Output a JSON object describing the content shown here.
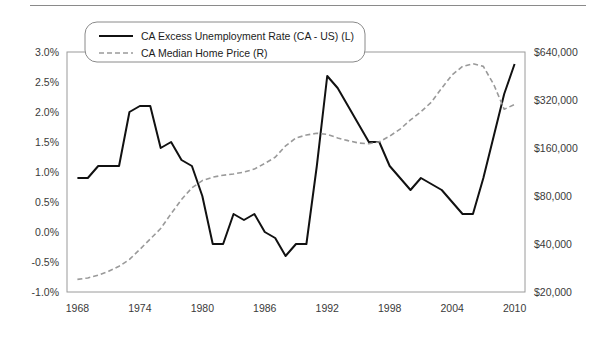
{
  "figure": {
    "background_color": "#ffffff",
    "top_rule_color": "#8a8a8a",
    "plot_border_color": "#9a9a9a"
  },
  "legend": {
    "position": "top-left-inside",
    "border_style": "rounded-rectangle",
    "entries": [
      {
        "label": "CA Excess Unemployment Rate (CA - US) (L)",
        "style": "solid",
        "color": "#111111",
        "axis": "left"
      },
      {
        "label": "CA Median Home Price (R)",
        "style": "dashed",
        "color": "#9a9a9a",
        "axis": "right"
      }
    ]
  },
  "chart_data": {
    "type": "line",
    "title": "",
    "subtitle": "",
    "xlabel": "",
    "ylabel": "",
    "grid": false,
    "legend_position": "upper left",
    "x": [
      1968,
      1969,
      1970,
      1971,
      1972,
      1973,
      1974,
      1975,
      1976,
      1977,
      1978,
      1979,
      1980,
      1981,
      1982,
      1983,
      1984,
      1985,
      1986,
      1987,
      1988,
      1989,
      1990,
      1991,
      1992,
      1993,
      1994,
      1995,
      1996,
      1997,
      1998,
      1999,
      2000,
      2001,
      2002,
      2003,
      2004,
      2005,
      2006,
      2007,
      2008,
      2009,
      2010
    ],
    "xlim": [
      1967,
      2011
    ],
    "xticks": [
      1968,
      1974,
      1980,
      1986,
      1992,
      1998,
      2004,
      2010
    ],
    "xticklabels": [
      "1968",
      "1974",
      "1980",
      "1986",
      "1992",
      "1998",
      "2004",
      "2010"
    ],
    "axes": [
      {
        "side": "left",
        "scale": "linear",
        "ylim": [
          -1.0,
          3.0
        ],
        "yticks": [
          -1.0,
          -0.5,
          0.0,
          0.5,
          1.0,
          1.5,
          2.0,
          2.5,
          3.0
        ],
        "yticklabels": [
          "-1.0%",
          "-0.5%",
          "0.0%",
          "0.5%",
          "1.0%",
          "1.5%",
          "2.0%",
          "2.5%",
          "3.0%"
        ],
        "unit": "percent"
      },
      {
        "side": "right",
        "scale": "log2",
        "ylim": [
          20000,
          640000
        ],
        "yticks": [
          20000,
          40000,
          80000,
          160000,
          320000,
          640000
        ],
        "yticklabels": [
          "$20,000",
          "$40,000",
          "$80,000",
          "$160,000",
          "$320,000",
          "$640,000"
        ],
        "unit": "dollars"
      }
    ],
    "series": [
      {
        "name": "CA Excess Unemployment Rate (CA - US) (L)",
        "axis": "left",
        "style": "solid",
        "color": "#111111",
        "width": 2.0,
        "values": [
          0.9,
          0.9,
          1.1,
          1.1,
          1.1,
          2.0,
          2.1,
          2.1,
          1.4,
          1.5,
          1.2,
          1.1,
          0.6,
          -0.2,
          -0.2,
          0.3,
          0.2,
          0.3,
          0.0,
          -0.1,
          -0.4,
          -0.2,
          -0.2,
          1.1,
          2.6,
          2.4,
          2.1,
          1.8,
          1.5,
          1.5,
          1.1,
          0.9,
          0.7,
          0.9,
          0.8,
          0.7,
          0.5,
          0.3,
          0.3,
          0.9,
          1.6,
          2.3,
          2.8
        ]
      },
      {
        "name": "CA Median Home Price (R)",
        "axis": "right",
        "style": "dashed",
        "color": "#9a9a9a",
        "width": 1.6,
        "values": [
          24000,
          24500,
          25500,
          27000,
          29000,
          32000,
          37000,
          43000,
          50000,
          62000,
          76000,
          90000,
          100000,
          105000,
          108000,
          110000,
          113000,
          118000,
          128000,
          140000,
          165000,
          185000,
          193000,
          198000,
          195000,
          185000,
          178000,
          172000,
          170000,
          175000,
          190000,
          210000,
          240000,
          270000,
          310000,
          380000,
          460000,
          520000,
          540000,
          520000,
          400000,
          280000,
          300000
        ]
      }
    ]
  }
}
